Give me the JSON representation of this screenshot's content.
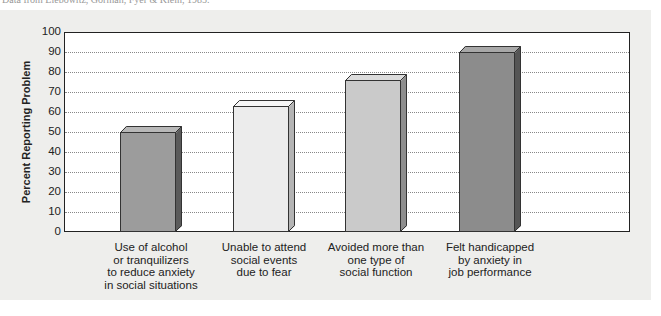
{
  "caption": "Data from Liebowitz, Gorman, Fyer & Klein, 1985.",
  "chart_data": {
    "type": "bar",
    "title": "",
    "xlabel": "",
    "ylabel": "Percent Reporting Problem",
    "ylim": [
      0,
      100
    ],
    "yticks": [
      0,
      10,
      20,
      30,
      40,
      50,
      60,
      70,
      80,
      90,
      100
    ],
    "grid": true,
    "legend": null,
    "categories": [
      "Use of alcohol or tranquilizers to reduce anxiety in social situations",
      "Unable to attend social events due to fear",
      "Avoided more than one type of social function",
      "Felt handicapped by anxiety in job performance"
    ],
    "category_lines": [
      [
        "Use of alcohol",
        "or tranquilizers",
        "to reduce anxiety",
        "in social situations"
      ],
      [
        "Unable to attend",
        "social events",
        "due to fear"
      ],
      [
        "Avoided more than",
        "one type of",
        "social function"
      ],
      [
        "Felt handicapped",
        "by anxiety in",
        "job performance"
      ]
    ],
    "values": [
      50,
      63,
      76,
      90
    ],
    "bar_colors": [
      "#9c9c9c",
      "#ececec",
      "#cacaca",
      "#8c8c8c"
    ],
    "top_colors": [
      "#b8b8b8",
      "#f6f6f6",
      "#dcdcdc",
      "#a8a8a8"
    ],
    "side_colors": [
      "#5a5a5a",
      "#b4b4b4",
      "#8e8e8e",
      "#555555"
    ]
  }
}
